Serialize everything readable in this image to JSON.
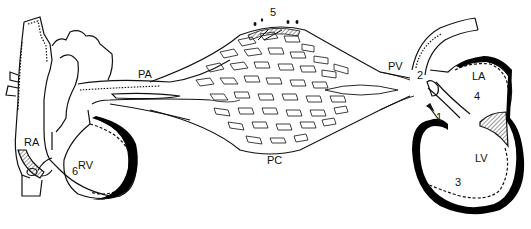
{
  "diagram": {
    "labels": {
      "ra": "RA",
      "rv": "RV",
      "pa": "PA",
      "pc": "PC",
      "pv": "PV",
      "la": "LA",
      "lv": "LV",
      "n1": "1",
      "n2": "2",
      "n3": "3",
      "n4": "4",
      "n5": "5",
      "n6": "6"
    },
    "colors": {
      "line": "#111111",
      "wall": "#000000",
      "background": "#ffffff"
    }
  }
}
